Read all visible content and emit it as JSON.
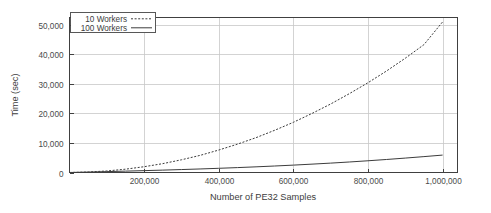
{
  "chart_data": {
    "type": "line",
    "title": "",
    "xlabel": "Number of PE32 Samples",
    "ylabel": "Time (sec)",
    "xlim": [
      0,
      1040000
    ],
    "ylim": [
      0,
      52500
    ],
    "grid": true,
    "legend_position": "top-left",
    "x_ticks": [
      {
        "value": 200000,
        "label": "200,000"
      },
      {
        "value": 400000,
        "label": "400,000"
      },
      {
        "value": 600000,
        "label": "600,000"
      },
      {
        "value": 800000,
        "label": "800,000"
      },
      {
        "value": 1000000,
        "label": "1,000,000"
      }
    ],
    "y_ticks": [
      {
        "value": 0,
        "label": "0"
      },
      {
        "value": 10000,
        "label": "10,000"
      },
      {
        "value": 20000,
        "label": "20,000"
      },
      {
        "value": 30000,
        "label": "30,000"
      },
      {
        "value": 40000,
        "label": "40,000"
      },
      {
        "value": 50000,
        "label": "50,000"
      }
    ],
    "x": [
      0,
      50000,
      100000,
      150000,
      200000,
      250000,
      300000,
      350000,
      400000,
      450000,
      500000,
      550000,
      600000,
      650000,
      700000,
      750000,
      800000,
      850000,
      900000,
      950000,
      1000000
    ],
    "series": [
      {
        "name": "10 Workers",
        "style": "dashed",
        "color": "#3c3c3c",
        "values": [
          0,
          160,
          520,
          1120,
          1960,
          3000,
          4300,
          5800,
          7600,
          9600,
          11800,
          14300,
          17000,
          20000,
          23200,
          26700,
          30400,
          34400,
          38700,
          43300,
          51000
        ]
      },
      {
        "name": "100 Workers",
        "style": "solid",
        "color": "#3c3c3c",
        "values": [
          0,
          140,
          300,
          460,
          630,
          810,
          1000,
          1200,
          1420,
          1660,
          1920,
          2200,
          2500,
          2830,
          3180,
          3560,
          3970,
          4410,
          4880,
          5380,
          5900
        ]
      }
    ]
  }
}
